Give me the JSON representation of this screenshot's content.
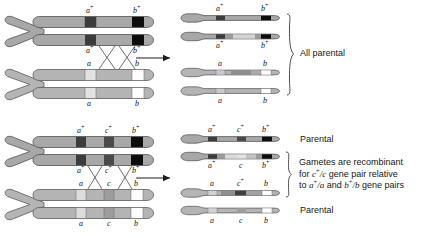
{
  "figure": {
    "colors": {
      "chromatid_body": "#a8a8a8",
      "chromatid_body_light": "#b4b4b4",
      "outline": "#4a4a4a",
      "band_dark": "#3c3c3c",
      "band_black": "#0d0d0d",
      "band_mid": "#8f8f8f",
      "band_light": "#d9d9d9",
      "band_white": "#fdfdfd",
      "text": "#161616"
    }
  },
  "panels": [
    {
      "id": "top-panel",
      "name": "two-gene-pair-crossover",
      "outcome_label": "All parental",
      "left": {
        "pair_top": {
          "name": "dominant-homolog",
          "top_labels": [
            "a+",
            "b+"
          ],
          "bottom_labels": [
            "a+",
            "b+"
          ]
        },
        "pair_bottom": {
          "name": "recessive-homolog",
          "top_labels": [
            "a",
            "b"
          ],
          "bottom_labels": [
            "a",
            "b"
          ]
        },
        "crossover_count": 2
      },
      "right": {
        "gametes": [
          {
            "name": "gamete-1",
            "type": "parental",
            "top_label": "a+",
            "bottom_label": "",
            "alleles": [
              "a+",
              "b+"
            ]
          },
          {
            "name": "gamete-2",
            "type": "parental",
            "top_label": "",
            "bottom_label": "a+",
            "alleles": [
              "a+",
              "b+"
            ]
          },
          {
            "name": "gamete-3",
            "type": "parental",
            "top_label": "a",
            "bottom_label": "",
            "alleles": [
              "a",
              "b"
            ]
          },
          {
            "name": "gamete-4",
            "type": "parental",
            "top_label": "",
            "bottom_label": "a",
            "alleles": [
              "a",
              "b"
            ]
          }
        ],
        "right_labels_top": [
          "a+",
          "b+"
        ],
        "right_labels_mid": [
          "a+",
          "b+"
        ],
        "right_labels_a": [
          "a",
          "b"
        ],
        "right_labels_bottom": [
          "a",
          "b"
        ]
      }
    },
    {
      "id": "bottom-panel",
      "name": "three-gene-pair-crossover",
      "left": {
        "pair_top": {
          "name": "dominant-homolog",
          "top_labels": [
            "a+",
            "c+",
            "b+"
          ],
          "bottom_labels": [
            "a+",
            "c+",
            "b+"
          ]
        },
        "pair_bottom": {
          "name": "recessive-homolog",
          "top_labels": [
            "a",
            "c",
            "b"
          ],
          "bottom_labels": [
            "a",
            "c",
            "b"
          ]
        },
        "crossover_count": 2
      },
      "right": {
        "gametes": [
          {
            "name": "gamete-1",
            "type": "parental",
            "alleles": [
              "a+",
              "c+",
              "b+"
            ]
          },
          {
            "name": "gamete-2",
            "type": "recombinant",
            "alleles": [
              "a+",
              "c",
              "b+"
            ]
          },
          {
            "name": "gamete-3",
            "type": "recombinant",
            "alleles": [
              "a",
              "c+",
              "b"
            ]
          },
          {
            "name": "gamete-4",
            "type": "parental",
            "alleles": [
              "a",
              "c",
              "b"
            ]
          }
        ],
        "labels_row1": [
          "a+",
          "c+",
          "b+"
        ],
        "labels_row2": [
          "a+",
          "c",
          "b+"
        ],
        "labels_row3": [
          "a",
          "c+",
          "b"
        ],
        "labels_row4": [
          "a",
          "c",
          "b"
        ]
      },
      "annotations": {
        "parental_top": "Parental",
        "parental_bottom": "Parental",
        "recombinant_line1": "Gametes are recombinant",
        "recombinant_line2_pre": "for ",
        "recombinant_line2_gene": "c+/c",
        "recombinant_line2_post": " gene pair relative",
        "recombinant_line3_pre": "to ",
        "recombinant_line3_gene1": "a+/a",
        "recombinant_line3_mid": " and ",
        "recombinant_line3_gene2": "b+/b",
        "recombinant_line3_post": " gene pairs"
      }
    }
  ]
}
